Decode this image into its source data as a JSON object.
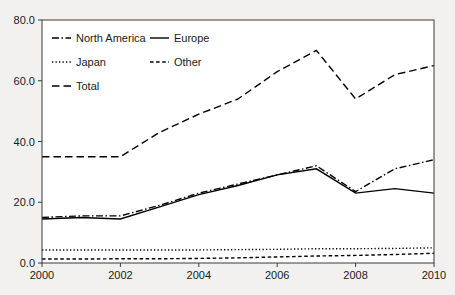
{
  "chart_data": {
    "type": "line",
    "title": "",
    "subtitle": "",
    "xlabel": "",
    "ylabel": "",
    "x": [
      2000,
      2001,
      2002,
      2003,
      2004,
      2005,
      2006,
      2007,
      2008,
      2009,
      2010
    ],
    "xlim": [
      2000,
      2010
    ],
    "ylim": [
      0.0,
      80.0
    ],
    "xticks": [
      2000,
      2002,
      2004,
      2006,
      2008,
      2010
    ],
    "xtick_labels": [
      "2000",
      "2002",
      "2004",
      "2006",
      "2008",
      "2010"
    ],
    "yticks": [
      0.0,
      20.0,
      40.0,
      60.0,
      80.0
    ],
    "ytick_labels": [
      "0.0",
      "20.0",
      "40.0",
      "60.0",
      "80.0"
    ],
    "grid": false,
    "legend_position": "upper-left-inside",
    "series": [
      {
        "name": "North America",
        "dash": "dashdot",
        "color": "#000000",
        "values": [
          15.0,
          15.5,
          15.5,
          19.0,
          23.0,
          26.0,
          29.0,
          32.0,
          23.5,
          31.0,
          34.0
        ]
      },
      {
        "name": "Europe",
        "dash": "solid",
        "color": "#000000",
        "values": [
          14.5,
          15.0,
          14.5,
          18.5,
          22.5,
          25.5,
          29.0,
          31.0,
          23.0,
          24.5,
          23.0
        ]
      },
      {
        "name": "Japan",
        "dash": "dotted",
        "color": "#000000",
        "values": [
          4.3,
          4.3,
          4.3,
          4.3,
          4.3,
          4.4,
          4.5,
          4.7,
          4.7,
          4.8,
          5.0
        ]
      },
      {
        "name": "Other",
        "dash": "shortdash",
        "color": "#000000",
        "values": [
          1.3,
          1.3,
          1.4,
          1.4,
          1.5,
          1.7,
          2.0,
          2.3,
          2.5,
          2.8,
          3.2
        ]
      },
      {
        "name": "Total",
        "dash": "longdash",
        "color": "#000000",
        "values": [
          35.0,
          35.0,
          35.0,
          43.0,
          49.0,
          54.0,
          63.0,
          70.0,
          54.0,
          62.0,
          65.0
        ]
      }
    ]
  },
  "legend": {
    "entries": [
      {
        "label": "North America",
        "dash": "dashdot"
      },
      {
        "label": "Europe",
        "dash": "solid"
      },
      {
        "label": "Japan",
        "dash": "dotted"
      },
      {
        "label": "Other",
        "dash": "shortdash"
      },
      {
        "label": "Total",
        "dash": "longdash"
      }
    ]
  },
  "colors": {
    "background": "#f2f1ef",
    "plot_background": "#ffffff",
    "axis": "#3a3a3a",
    "series": "#000000",
    "text": "#1a1a1a"
  }
}
